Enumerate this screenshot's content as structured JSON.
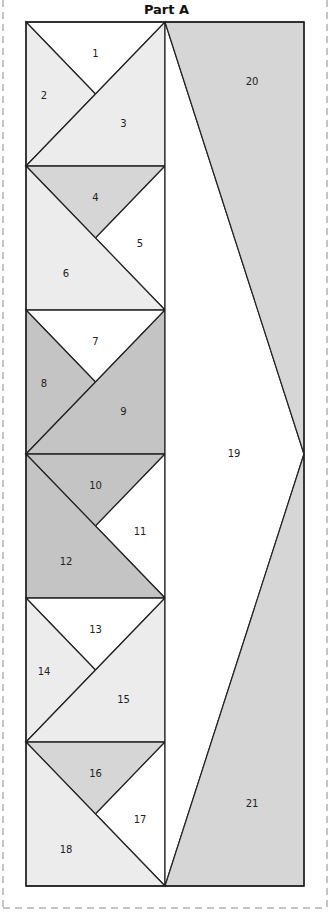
{
  "title": "Part A",
  "colors": {
    "white": "#ffffff",
    "light": "#ececec",
    "medium": "#d6d6d6",
    "dark": "#c4c4c4",
    "line": "#222222",
    "dashed_border": "#8a8a8a"
  },
  "pieces": [
    {
      "id": "1",
      "label": "1",
      "fill": "white"
    },
    {
      "id": "2",
      "label": "2",
      "fill": "light"
    },
    {
      "id": "3",
      "label": "3",
      "fill": "light"
    },
    {
      "id": "4",
      "label": "4",
      "fill": "medium"
    },
    {
      "id": "5",
      "label": "5",
      "fill": "white"
    },
    {
      "id": "6",
      "label": "6",
      "fill": "light"
    },
    {
      "id": "7",
      "label": "7",
      "fill": "white"
    },
    {
      "id": "8",
      "label": "8",
      "fill": "dark"
    },
    {
      "id": "9",
      "label": "9",
      "fill": "dark"
    },
    {
      "id": "10",
      "label": "10",
      "fill": "dark"
    },
    {
      "id": "11",
      "label": "11",
      "fill": "white"
    },
    {
      "id": "12",
      "label": "12",
      "fill": "dark"
    },
    {
      "id": "13",
      "label": "13",
      "fill": "white"
    },
    {
      "id": "14",
      "label": "14",
      "fill": "light"
    },
    {
      "id": "15",
      "label": "15",
      "fill": "light"
    },
    {
      "id": "16",
      "label": "16",
      "fill": "medium"
    },
    {
      "id": "17",
      "label": "17",
      "fill": "white"
    },
    {
      "id": "18",
      "label": "18",
      "fill": "light"
    },
    {
      "id": "19",
      "label": "19",
      "fill": "white"
    },
    {
      "id": "20",
      "label": "20",
      "fill": "medium"
    },
    {
      "id": "21",
      "label": "21",
      "fill": "medium"
    }
  ]
}
